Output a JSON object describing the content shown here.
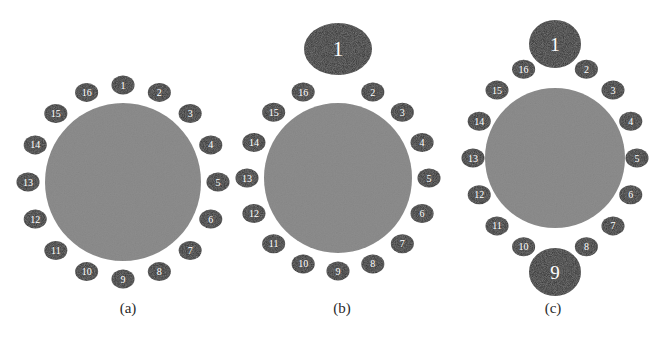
{
  "figure": {
    "background": "#ffffff",
    "width": 665,
    "height": 354,
    "colors": {
      "core": "#8d8d8d",
      "node": "#2b2b2b",
      "node_label": "#ffffff",
      "caption": "#2a2a2a",
      "background": "#ffffff"
    }
  },
  "chart_data": {
    "type": "diagram",
    "title": "",
    "node_count": 16,
    "node_labels": [
      "1",
      "2",
      "3",
      "4",
      "5",
      "6",
      "7",
      "8",
      "9",
      "10",
      "11",
      "12",
      "13",
      "14",
      "15",
      "16"
    ],
    "panels": [
      {
        "id": "a",
        "caption": "(a)",
        "caption_x": 128,
        "caption_y": 313,
        "core": {
          "cx": 123,
          "cy": 182,
          "rx": 78,
          "ry": 79
        },
        "ring": {
          "rx": 95,
          "ry": 97
        },
        "node_size": {
          "rx": 11.5,
          "ry": 9.5
        },
        "enlarged": [],
        "enlarged_size": {
          "rx": 11.5,
          "ry": 9.5
        },
        "nodes": [
          {
            "label": "1",
            "angle": -90,
            "big": false
          },
          {
            "label": "2",
            "angle": -67.5,
            "big": false
          },
          {
            "label": "3",
            "angle": -45,
            "big": false
          },
          {
            "label": "4",
            "angle": -22.5,
            "big": false
          },
          {
            "label": "5",
            "angle": 0,
            "big": false
          },
          {
            "label": "6",
            "angle": 22.5,
            "big": false
          },
          {
            "label": "7",
            "angle": 45,
            "big": false
          },
          {
            "label": "8",
            "angle": 67.5,
            "big": false
          },
          {
            "label": "9",
            "angle": 90,
            "big": false
          },
          {
            "label": "10",
            "angle": 112.5,
            "big": false
          },
          {
            "label": "11",
            "angle": 135,
            "big": false
          },
          {
            "label": "12",
            "angle": 157.5,
            "big": false
          },
          {
            "label": "13",
            "angle": 180,
            "big": false
          },
          {
            "label": "14",
            "angle": 202.5,
            "big": false
          },
          {
            "label": "15",
            "angle": 225,
            "big": false
          },
          {
            "label": "16",
            "angle": 247.5,
            "big": false
          }
        ]
      },
      {
        "id": "b",
        "caption": "(b)",
        "caption_x": 342,
        "caption_y": 313,
        "core": {
          "cx": 338,
          "cy": 178,
          "rx": 74,
          "ry": 75
        },
        "ring": {
          "rx": 91,
          "ry": 93
        },
        "node_size": {
          "rx": 11.5,
          "ry": 9.5
        },
        "enlarged": [
          "1"
        ],
        "enlarged_size": {
          "rx": 34,
          "ry": 26
        },
        "enlarged_offset": 36,
        "nodes": [
          {
            "label": "1",
            "angle": -90,
            "big": true
          },
          {
            "label": "2",
            "angle": -67.5,
            "big": false
          },
          {
            "label": "3",
            "angle": -45,
            "big": false
          },
          {
            "label": "4",
            "angle": -22.5,
            "big": false
          },
          {
            "label": "5",
            "angle": 0,
            "big": false
          },
          {
            "label": "6",
            "angle": 22.5,
            "big": false
          },
          {
            "label": "7",
            "angle": 45,
            "big": false
          },
          {
            "label": "8",
            "angle": 67.5,
            "big": false
          },
          {
            "label": "9",
            "angle": 90,
            "big": false
          },
          {
            "label": "10",
            "angle": 112.5,
            "big": false
          },
          {
            "label": "11",
            "angle": 135,
            "big": false
          },
          {
            "label": "12",
            "angle": 157.5,
            "big": false
          },
          {
            "label": "13",
            "angle": 180,
            "big": false
          },
          {
            "label": "14",
            "angle": 202.5,
            "big": false
          },
          {
            "label": "15",
            "angle": 225,
            "big": false
          },
          {
            "label": "16",
            "angle": 247.5,
            "big": false
          }
        ]
      },
      {
        "id": "c",
        "caption": "(c)",
        "caption_x": 553,
        "caption_y": 313,
        "core": {
          "cx": 555,
          "cy": 158,
          "rx": 70,
          "ry": 70
        },
        "ring": {
          "rx": 82,
          "ry": 96
        },
        "node_size": {
          "rx": 11.5,
          "ry": 9.5
        },
        "enlarged": [
          "1",
          "9"
        ],
        "enlarged_size": {
          "rx": 26,
          "ry": 24
        },
        "enlarged_offset": 18,
        "nodes": [
          {
            "label": "1",
            "angle": -90,
            "big": true
          },
          {
            "label": "2",
            "angle": -67.5,
            "big": false
          },
          {
            "label": "3",
            "angle": -45,
            "big": false
          },
          {
            "label": "4",
            "angle": -22.5,
            "big": false
          },
          {
            "label": "5",
            "angle": 0,
            "big": false
          },
          {
            "label": "6",
            "angle": 22.5,
            "big": false
          },
          {
            "label": "7",
            "angle": 45,
            "big": false
          },
          {
            "label": "8",
            "angle": 67.5,
            "big": false
          },
          {
            "label": "9",
            "angle": 90,
            "big": true
          },
          {
            "label": "10",
            "angle": 112.5,
            "big": false
          },
          {
            "label": "11",
            "angle": 135,
            "big": false
          },
          {
            "label": "12",
            "angle": 157.5,
            "big": false
          },
          {
            "label": "13",
            "angle": 180,
            "big": false
          },
          {
            "label": "14",
            "angle": 202.5,
            "big": false
          },
          {
            "label": "15",
            "angle": 225,
            "big": false
          },
          {
            "label": "16",
            "angle": 247.5,
            "big": false
          }
        ]
      }
    ]
  }
}
